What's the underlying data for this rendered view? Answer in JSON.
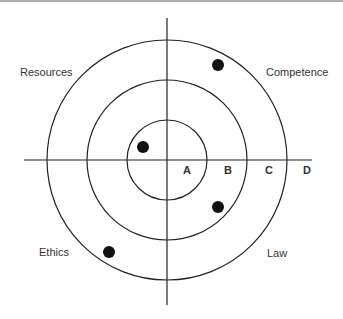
{
  "diagram": {
    "type": "target-quadrant-diagram",
    "center": {
      "x": 167,
      "y": 160
    },
    "rings": [
      {
        "id": "A",
        "radius": 40
      },
      {
        "id": "B",
        "radius": 80
      },
      {
        "id": "C",
        "radius": 120
      }
    ],
    "ring_labels": [
      {
        "text": "A",
        "x": 187,
        "y": 175
      },
      {
        "text": "B",
        "x": 227,
        "y": 175
      },
      {
        "text": "C",
        "x": 267,
        "y": 175
      },
      {
        "text": "D",
        "x": 307,
        "y": 175
      }
    ],
    "quadrant_labels": {
      "top_left": "Resources",
      "top_right": "Competence",
      "bottom_left": "Ethics",
      "bottom_right": "Law"
    },
    "points": [
      {
        "quadrant": "Competence",
        "ring": "C",
        "x": 218,
        "y": 65
      },
      {
        "quadrant": "Resources",
        "ring": "A",
        "x": 143,
        "y": 147
      },
      {
        "quadrant": "Law",
        "ring": "B",
        "x": 218,
        "y": 207
      },
      {
        "quadrant": "Ethics",
        "ring": "C",
        "x": 109,
        "y": 252
      }
    ],
    "colors": {
      "line": "#222222",
      "point": "#111111",
      "text": "#333333"
    }
  }
}
